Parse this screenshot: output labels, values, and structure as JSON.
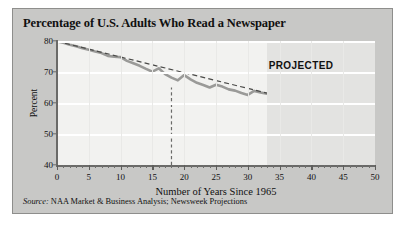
{
  "figure": {
    "title": "Percentage of U.S. Adults Who Read a Newspaper",
    "source_prefix": "Source:",
    "source_text": "NAA Market & Business Analysis; Newsweek Projections",
    "projected_label": "PROJECTED",
    "card_bg": "#c8c8c6",
    "plot_bg": "#f2f2f0",
    "projected_bg": "#e3e3e1",
    "series_color": "#9a9a98",
    "trend_color": "#4a4a48",
    "grid_color": "#ffffff",
    "axis_color": "#6a6a68"
  },
  "chart_data": {
    "type": "line",
    "title": "Percentage of U.S. Adults Who Read a Newspaper",
    "xlabel": "Number of Years Since 1965",
    "ylabel": "Percent",
    "xlim": [
      0,
      50
    ],
    "ylim": [
      40,
      80
    ],
    "xticks": [
      0,
      5,
      10,
      15,
      20,
      25,
      30,
      35,
      40,
      45,
      50
    ],
    "xtick_labels": [
      "0",
      "5",
      "10",
      "15",
      "20",
      "25",
      "30",
      "35",
      "40",
      "45",
      "50"
    ],
    "yticks": [
      40,
      50,
      60,
      70,
      80
    ],
    "ytick_labels": [
      "40",
      "50",
      "60",
      "70",
      "80"
    ],
    "minor_xtick_step": 1,
    "grid": "horizontal-white-major, vertical-faint-major",
    "legend": "none",
    "annotations": [
      {
        "text": "PROJECTED",
        "x": 38,
        "y": 72
      },
      {
        "text": "vertical dashed marker",
        "x": 18,
        "y_from": 40,
        "y_to": 65
      }
    ],
    "projected_region": {
      "x_start": 33,
      "x_end": 50
    },
    "series": [
      {
        "name": "Percent of U.S. adults who read a newspaper",
        "style": "solid-thick-gray",
        "x": [
          0,
          1,
          2,
          3,
          4,
          5,
          6,
          7,
          8,
          9,
          10,
          11,
          12,
          13,
          14,
          15,
          16,
          17,
          18,
          19,
          20,
          21,
          22,
          23,
          24,
          25,
          26,
          27,
          28,
          29,
          30,
          31,
          32,
          33,
          34,
          35,
          36,
          37,
          38,
          39,
          40,
          41,
          42,
          43,
          44,
          45,
          46,
          47,
          48,
          49,
          50
        ],
        "y": [
          79.9,
          79.4,
          78.8,
          78.3,
          77.7,
          77.2,
          76.6,
          76.1,
          75.2,
          74.9,
          74.8,
          73.6,
          72.8,
          72.0,
          71.0,
          70.1,
          71.2,
          69.3,
          68.2,
          67.3,
          69.0,
          67.6,
          66.5,
          65.8,
          65.0,
          65.9,
          65.3,
          64.4,
          64.0,
          63.2,
          62.6,
          63.9,
          63.4,
          63.0,
          62.4,
          61.9,
          61.3,
          60.7,
          60.2,
          59.6,
          59.0,
          58.4,
          57.0,
          56.1,
          55.0,
          54.0,
          53.0,
          52.0,
          51.0,
          49.8,
          48.2
        ]
      },
      {
        "name": "Linear trend line",
        "style": "dashed-dark",
        "x": [
          0,
          33
        ],
        "y": [
          79.9,
          63.2
        ]
      }
    ]
  }
}
